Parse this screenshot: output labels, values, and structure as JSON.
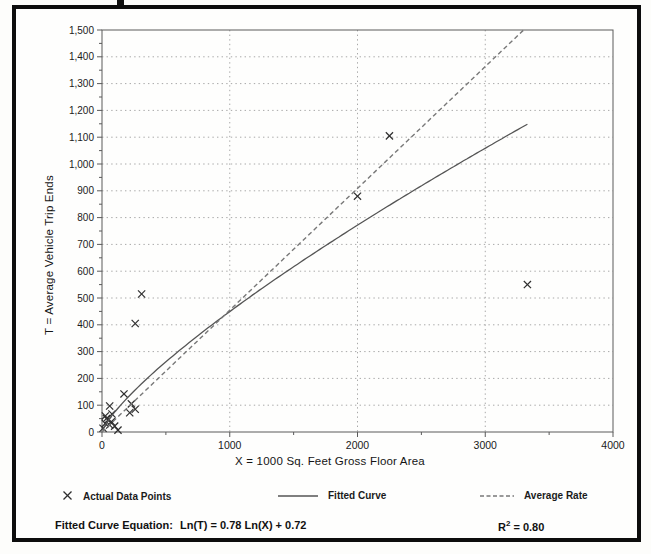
{
  "figure": {
    "x_axis_title": "X = 1000 Sq. Feet Gross Floor Area",
    "y_axis_title": "T = Average Vehicle Trip Ends",
    "equation_prefix": "Fitted Curve Equation:",
    "equation_body": "Ln(T) = 0.78 Ln(X) + 0.72",
    "r_squared": {
      "base": "R",
      "exponent": "2",
      "rest": " = 0.80"
    }
  },
  "legend": {
    "points_label": "Actual Data Points",
    "fitted_label": "Fitted Curve",
    "rate_label": "Average Rate"
  },
  "colors": {
    "frame": "#0d0d0d",
    "axis": "#5a5a5a",
    "grid": "#a8a8a8",
    "marker": "#2e2e2e",
    "fitted_curve": "#555555",
    "average_rate": "#787878",
    "text": "#1b1b1b"
  },
  "chart_data": {
    "type": "scatter",
    "title": "",
    "xlabel": "X = 1000 Sq. Feet Gross Floor Area",
    "ylabel": "T = Average Vehicle Trip Ends",
    "xlim": [
      0,
      4000
    ],
    "ylim": [
      0,
      1500
    ],
    "grid": "dotted horizontal every 100, vertical every 1000",
    "legend_position": "bottom",
    "x_ticks": [
      {
        "value": 0,
        "label": "0"
      },
      {
        "value": 1000,
        "label": "1000"
      },
      {
        "value": 2000,
        "label": "2000"
      },
      {
        "value": 3000,
        "label": "3000"
      },
      {
        "value": 4000,
        "label": "4000"
      }
    ],
    "x_minor_tick_values": [
      500,
      1500,
      2500,
      3500
    ],
    "y_ticks": [
      {
        "value": 0,
        "label": "0"
      },
      {
        "value": 100,
        "label": "100"
      },
      {
        "value": 200,
        "label": "200"
      },
      {
        "value": 300,
        "label": "300"
      },
      {
        "value": 400,
        "label": "400"
      },
      {
        "value": 500,
        "label": "500"
      },
      {
        "value": 600,
        "label": "600"
      },
      {
        "value": 700,
        "label": "700"
      },
      {
        "value": 800,
        "label": "800"
      },
      {
        "value": 900,
        "label": "900"
      },
      {
        "value": 1000,
        "label": "1,000"
      },
      {
        "value": 1100,
        "label": "1,100"
      },
      {
        "value": 1200,
        "label": "1,200"
      },
      {
        "value": 1300,
        "label": "1,300"
      },
      {
        "value": 1400,
        "label": "1,400"
      },
      {
        "value": 1500,
        "label": "1,500"
      }
    ],
    "y_minor_step": 50,
    "series": [
      {
        "name": "Actual Data Points",
        "type": "scatter",
        "marker": "x",
        "points": [
          [
            8,
            14
          ],
          [
            26,
            32
          ],
          [
            26,
            60
          ],
          [
            35,
            50
          ],
          [
            47,
            45
          ],
          [
            60,
            26
          ],
          [
            60,
            97
          ],
          [
            73,
            38
          ],
          [
            78,
            67
          ],
          [
            99,
            22
          ],
          [
            125,
            7
          ],
          [
            172,
            142
          ],
          [
            217,
            72
          ],
          [
            230,
            105
          ],
          [
            260,
            85
          ],
          [
            260,
            405
          ],
          [
            310,
            515
          ],
          [
            2000,
            880
          ],
          [
            2250,
            1105
          ],
          [
            3330,
            550
          ]
        ]
      },
      {
        "name": "Fitted Curve",
        "type": "power-curve",
        "equation": "Ln(T) = 0.78 Ln(X) + 0.72",
        "exponent": 0.78,
        "intercept_ln": 0.72,
        "x_range": [
          5,
          3330
        ]
      },
      {
        "name": "Average Rate",
        "type": "line-through-origin",
        "slope": 0.4545,
        "x_range": [
          0,
          3300
        ]
      }
    ],
    "annotations": [
      "Fitted Curve Equation:  Ln(T) = 0.78 Ln(X) + 0.72",
      "R2 = 0.80"
    ]
  }
}
